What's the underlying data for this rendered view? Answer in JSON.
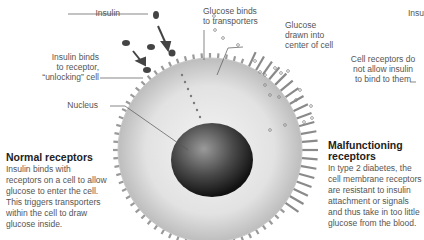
{
  "labels": {
    "insulin": "Insulin",
    "insulin_binds": [
      "Insulin binds",
      "to receptor,",
      "“unlocking” cell"
    ],
    "nucleus": "Nucleus",
    "glucose_binds": [
      "Glucose binds",
      "to transporters"
    ],
    "glucose_drawn": [
      "Glucose",
      "drawn into",
      "center of cell"
    ],
    "insulin_right": "Insu",
    "receptors_block": [
      "Cell receptors do",
      "not allow insulin",
      "to bind to them"
    ]
  },
  "normal": {
    "heading": "Normal receptors",
    "body": [
      "Insulin binds with",
      "receptors on a cell to allow",
      "glucose to enter the cell.",
      "This triggers transporters",
      "within the cell to draw",
      "glucose inside."
    ]
  },
  "malfunctioning": {
    "heading": [
      "Malfunctioning",
      "receptors"
    ],
    "body": [
      "In type 2 diabetes, the",
      "cell membrane receptors",
      "are resistant to insulin",
      "attachment or signals",
      "and thus take in too little",
      "glucose from the blood."
    ]
  },
  "colors": {
    "cell_fill": "#dcdcdc",
    "membrane": "#b5b5b5",
    "nucleus": "#3a3a3a",
    "glucose_dot": "#8a8a8a",
    "leader_line": "#555555"
  }
}
